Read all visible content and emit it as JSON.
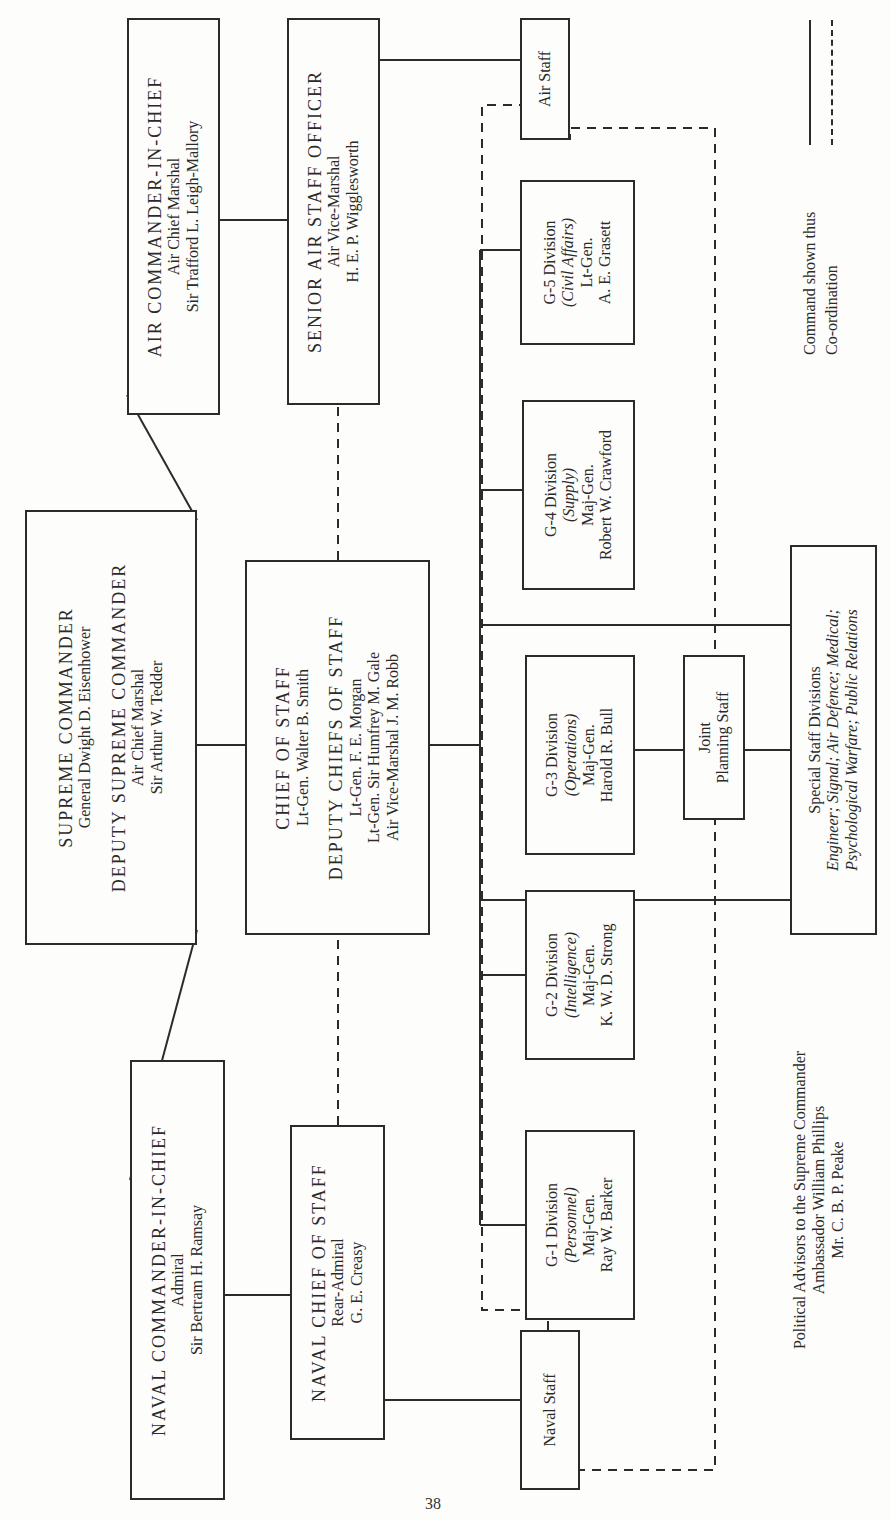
{
  "page_number": "38",
  "legend": {
    "command_label": "Command shown thus",
    "coordination_label": "Co-ordination"
  },
  "naval_cinc": {
    "title": "NAVAL COMMANDER-IN-CHIEF",
    "rank": "Admiral",
    "name": "Sir Bertram H. Ramsay"
  },
  "supreme": {
    "title": "SUPREME COMMANDER",
    "name": "General Dwight D. Eisenhower",
    "deputy_title": "DEPUTY SUPREME COMMANDER",
    "deputy_rank": "Air Chief Marshal",
    "deputy_name": "Sir Arthur W. Tedder"
  },
  "air_cinc": {
    "title": "AIR COMMANDER-IN-CHIEF",
    "rank": "Air Chief Marshal",
    "name": "Sir Trafford L. Leigh-Mallory"
  },
  "naval_cos": {
    "title": "NAVAL CHIEF OF STAFF",
    "rank": "Rear-Admiral",
    "name": "G. E. Creasy"
  },
  "chief_of_staff": {
    "title": "CHIEF OF STAFF",
    "name": "Lt-Gen. Walter B. Smith",
    "deputies_title": "DEPUTY CHIEFS OF STAFF",
    "deputies": [
      "Lt-Gen. F. E. Morgan",
      "Lt-Gen. Sir Humfrey M. Gale",
      "Air Vice-Marshal J. M. Robb"
    ]
  },
  "senior_air": {
    "title": "SENIOR AIR STAFF OFFICER",
    "rank": "Air Vice-Marshal",
    "name": "H. E. P. Wigglesworth"
  },
  "naval_staff": {
    "label": "Naval Staff"
  },
  "air_staff": {
    "label": "Air Staff"
  },
  "divisions": [
    {
      "title": "G-1 Division",
      "area": "(Personnel)",
      "rank": "Maj-Gen.",
      "name": "Ray W. Barker"
    },
    {
      "title": "G-2 Division",
      "area": "(Intelligence)",
      "rank": "Maj-Gen.",
      "name": "K. W. D. Strong"
    },
    {
      "title": "G-3 Division",
      "area": "(Operations)",
      "rank": "Maj-Gen.",
      "name": "Harold R. Bull"
    },
    {
      "title": "G-4 Division",
      "area": "(Supply)",
      "rank": "Maj-Gen.",
      "name": "Robert W. Crawford"
    },
    {
      "title": "G-5 Division",
      "area": "(Civil Affairs)",
      "rank": "Lt-Gen.",
      "name": "A. E. Grasett"
    }
  ],
  "joint_planning": {
    "line1": "Joint",
    "line2": "Planning Staff"
  },
  "special_staff": {
    "title": "Special Staff Divisions",
    "line1": "Engineer; Signal; Air Defence; Medical;",
    "line2": "Psychological Warfare; Public Relations"
  },
  "political": {
    "title": "Political Advisors to the Supreme Commander",
    "advisor1": "Ambassador William Phillips",
    "advisor2": "Mr. C. B. P. Peake"
  }
}
